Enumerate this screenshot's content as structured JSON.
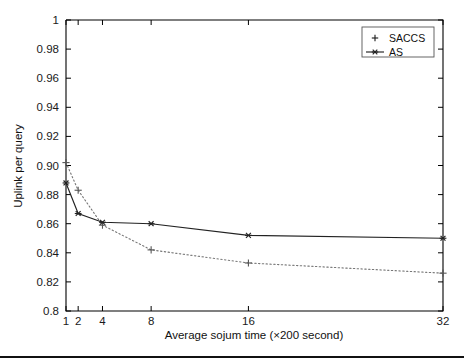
{
  "chart_data": {
    "type": "line",
    "title": "",
    "xlabel": "Average sojum time (×200 second)",
    "ylabel": "Uplink per query",
    "xlim": [
      1,
      32
    ],
    "ylim": [
      0.8,
      1
    ],
    "xscale": "linear",
    "grid": false,
    "legend_position": "top-right",
    "xticks": [
      1,
      2,
      4,
      8,
      16,
      32
    ],
    "xticklabels": [
      "1",
      "2",
      "4",
      "8",
      "16",
      "32"
    ],
    "yticks": [
      0.8,
      0.82,
      0.84,
      0.86,
      0.88,
      0.9,
      0.92,
      0.94,
      0.96,
      0.98,
      1
    ],
    "yticklabels": [
      "0.8",
      "0.82",
      "0.84",
      "0.86",
      "0.88",
      "0.90",
      "0.92",
      "0.94",
      "0.96",
      "0.98",
      "1"
    ],
    "x": [
      1,
      2,
      4,
      8,
      16,
      32
    ],
    "series": [
      {
        "name": "SACCS",
        "marker": "plus",
        "linestyle": "dotted",
        "color": "#777777",
        "values": [
          0.902,
          0.883,
          0.859,
          0.842,
          0.833,
          0.826
        ]
      },
      {
        "name": "AS",
        "marker": "asterisk",
        "linestyle": "solid",
        "color": "#222222",
        "values": [
          0.888,
          0.867,
          0.861,
          0.86,
          0.852,
          0.85
        ]
      }
    ]
  },
  "legend": {
    "entries": [
      {
        "label": "SACCS",
        "marker": "plus",
        "linestyle": "none"
      },
      {
        "label": "AS",
        "marker": "asterisk",
        "linestyle": "solid"
      }
    ]
  },
  "colors": {
    "axis": "#000000",
    "solid_series": "#222222",
    "dotted_series": "#777777",
    "background": "#ffffff",
    "footer_rule": "#111111"
  }
}
